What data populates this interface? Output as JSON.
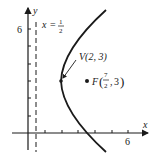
{
  "diagram": {
    "type": "parabola-with-directrix",
    "equation": "(y-3)^2 = 6(x-2)",
    "axes": {
      "x_label": "x",
      "y_label": "y",
      "x_tick_label": "6",
      "y_tick_label": "6"
    },
    "directrix": {
      "label_var": "x",
      "label_eq": "=",
      "label_num": "1",
      "label_den": "2"
    },
    "vertex": {
      "label": "V(2, 3)"
    },
    "focus": {
      "label_prefix": "F",
      "label_num": "7",
      "label_den": "2",
      "label_y": "3"
    },
    "colors": {
      "ink": "#1a1a1a",
      "background": "#ffffff"
    }
  }
}
